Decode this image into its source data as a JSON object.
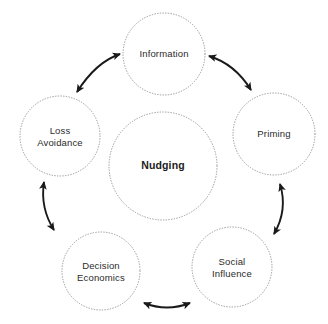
{
  "diagram": {
    "title": "Nudging",
    "type": "circular-cycle-diagram",
    "background_color": "#ffffff",
    "circle_stroke_color": "#9a9a9a",
    "circle_stroke_style": "dotted",
    "arrow_color": "#1a1a1a",
    "label_color": "#2b2b2b",
    "center": {
      "name": "nudging",
      "label": "Nudging",
      "cx": 163,
      "cy": 166,
      "r": 54,
      "bold": true
    },
    "nodes": [
      {
        "name": "information",
        "label": "Information",
        "cx": 164,
        "cy": 54,
        "r": 41
      },
      {
        "name": "priming",
        "label": "Priming",
        "cx": 274,
        "cy": 134,
        "r": 41
      },
      {
        "name": "social-influence",
        "label": "Social\nInfluence",
        "cx": 232,
        "cy": 267,
        "r": 40
      },
      {
        "name": "decision-economics",
        "label": "Decision\nEconomics",
        "cx": 101,
        "cy": 271,
        "r": 39
      },
      {
        "name": "loss-avoidance",
        "label": "Loss\nAvoidance",
        "cx": 60,
        "cy": 136,
        "r": 40
      }
    ],
    "connectors": [
      {
        "name": "arrow-loss-avoidance-information",
        "from": "loss-avoidance",
        "to": "information",
        "double_headed": true,
        "path": "M 77 92 Q 96 62 120 54"
      },
      {
        "name": "arrow-information-priming",
        "from": "information",
        "to": "priming",
        "double_headed": true,
        "path": "M 209 56 Q 235 64 251 90"
      },
      {
        "name": "arrow-priming-social-influence",
        "from": "priming",
        "to": "social-influence",
        "double_headed": true,
        "path": "M 280 184 Q 288 210 274 234"
      },
      {
        "name": "arrow-social-influence-decision-economics",
        "from": "social-influence",
        "to": "decision-economics",
        "double_headed": true,
        "path": "M 190 303 Q 167 312 144 303"
      },
      {
        "name": "arrow-decision-economics-loss-avoidance",
        "from": "decision-economics",
        "to": "loss-avoidance",
        "double_headed": true,
        "path": "M 54 230 Q 40 208 44 182"
      }
    ]
  }
}
